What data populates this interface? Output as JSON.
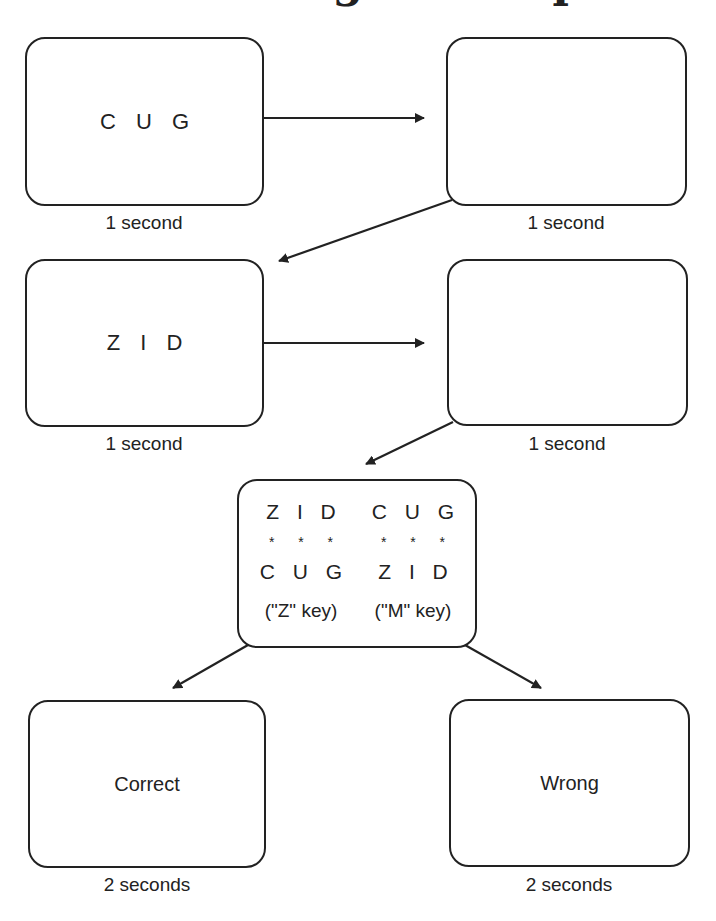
{
  "title": {
    "partial_text": "Trial Design Example",
    "note_visible": "title is cut off at top edge; only descenders visible"
  },
  "boxes": [
    {
      "id": "study-1",
      "content": "C U G",
      "duration": "1 second"
    },
    {
      "id": "blank-1",
      "content": "",
      "duration": "1 second"
    },
    {
      "id": "study-2",
      "content": "Z I D",
      "duration": "1 second"
    },
    {
      "id": "blank-2",
      "content": "",
      "duration": "1 second"
    }
  ],
  "choice": {
    "left": {
      "top": "Z I D",
      "stars": "* * *",
      "bottom": "C U G",
      "key": "(\"Z\" key)"
    },
    "right": {
      "top": "C U G",
      "stars": "* * *",
      "bottom": "Z I D",
      "key": "(\"M\" key)"
    }
  },
  "feedback": [
    {
      "id": "correct",
      "label": "Correct",
      "duration": "2 seconds"
    },
    {
      "id": "wrong",
      "label": "Wrong",
      "duration": "2 seconds"
    }
  ]
}
